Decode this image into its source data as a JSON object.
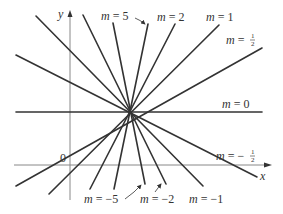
{
  "diagram": {
    "axes": {
      "x_label": "x",
      "y_label": "y",
      "origin_label": "0",
      "color": "#888888"
    },
    "line_color": "#333333",
    "center": {
      "x": 131,
      "y": 112
    },
    "lines": [
      {
        "slope": "5",
        "label": "m = 5",
        "x1": 113,
        "y1": 23,
        "x2": 145,
        "y2": 184
      },
      {
        "slope": "2",
        "label": "m = 2",
        "x1": 175,
        "y1": 24,
        "x2": 90,
        "y2": 189
      },
      {
        "slope": "1",
        "label": "m = 1",
        "x1": 219,
        "y1": 25,
        "x2": 49,
        "y2": 194
      },
      {
        "slope": "1/2",
        "label": "m = 1/2",
        "x1": 262,
        "y1": 48,
        "x2": 16,
        "y2": 186
      },
      {
        "slope": "0",
        "label": "m = 0",
        "x1": 16,
        "y1": 112,
        "x2": 262,
        "y2": 112
      },
      {
        "slope": "-1/2",
        "label": "m = -1/2",
        "x1": 16,
        "y1": 55,
        "x2": 257,
        "y2": 177
      },
      {
        "slope": "-1",
        "label": "m = -1",
        "x1": 36,
        "y1": 16,
        "x2": 203,
        "y2": 186
      },
      {
        "slope": "-2",
        "label": "m = -2",
        "x1": 83,
        "y1": 15,
        "x2": 166,
        "y2": 184
      },
      {
        "slope": "-5",
        "label": "m = -5",
        "x1": 148,
        "y1": 24,
        "x2": 114,
        "y2": 189
      }
    ],
    "labels": {
      "m5": {
        "m": "m",
        "eq": " = 5"
      },
      "m2": {
        "m": "m",
        "eq": " = 2"
      },
      "m1": {
        "m": "m",
        "eq": " = 1"
      },
      "mhalf": {
        "m": "m",
        "eq": " = ",
        "num": "1",
        "den": "2"
      },
      "m0": {
        "m": "m",
        "eq": " = 0"
      },
      "mneghalf": {
        "m": "m",
        "eq": " = −",
        "num": "1",
        "den": "2"
      },
      "mneg1": {
        "m": "m",
        "eq": " = −1"
      },
      "mneg2": {
        "m": "m",
        "eq": " = −2"
      },
      "mneg5": {
        "m": "m",
        "eq": " = −5"
      }
    }
  }
}
